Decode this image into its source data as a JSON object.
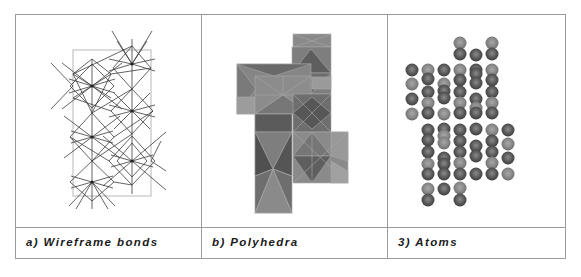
{
  "figure": {
    "panels": [
      {
        "id": "a",
        "caption": "a) Wireframe bonds",
        "representation": "wireframe"
      },
      {
        "id": "b",
        "caption": "b) Polyhedra",
        "representation": "polyhedra"
      },
      {
        "id": "c",
        "caption": "3) Atoms",
        "representation": "atoms"
      }
    ]
  },
  "colors": {
    "border": "#9a9a9a",
    "wire": "#3c3c3c",
    "cell": "#b0b0b0",
    "poly_light": "#8e8e8e",
    "poly_mid": "#7a7a7a",
    "poly_dark": "#5e5e5e",
    "atom_dark": "#5a5a5a",
    "atom_light": "#8a8a8a"
  }
}
